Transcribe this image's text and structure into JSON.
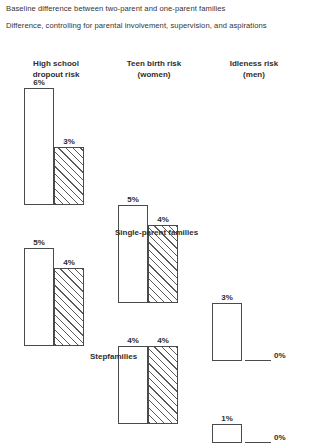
{
  "legend": {
    "lines": [
      "Baseline difference between two-parent and one-parent families",
      "Difference, controlling for parental involvement, supervision, and aspirations"
    ]
  },
  "columns": [
    {
      "title": "High school",
      "subtitle": "dropout risk"
    },
    {
      "title": "Teen birth risk",
      "subtitle": "(women)"
    },
    {
      "title": "Idleness risk",
      "subtitle": "(men)"
    }
  ],
  "groups": [
    {
      "label": "Single-parent families"
    },
    {
      "label": "Stepfamilies"
    }
  ],
  "footnote": "",
  "colors": {
    "bar_outline": "#4a4a4a",
    "bar_fill": "#ffffff",
    "hatch": "#5a5a5a",
    "text": "#2e2e2e",
    "background": "#ffffff"
  },
  "chart_data": {
    "type": "bar",
    "title": "Baseline difference between two-parent and one-parent families",
    "xlabel": "",
    "ylabel": "",
    "ylim": [
      0,
      6
    ],
    "grid": false,
    "legend_position": "top",
    "categories": [
      "High school dropout risk",
      "Teen birth risk (women)",
      "Idleness risk (men)"
    ],
    "panels": [
      {
        "name": "Single-parent families",
        "series": [
          {
            "name": "Baseline difference between two-parent and one-parent families",
            "values": [
              6,
              5,
              3
            ],
            "labels": [
              "6%",
              "5%",
              "3%"
            ],
            "style": "solid"
          },
          {
            "name": "Difference, controlling for parental involvement, supervision, and aspirations",
            "values": [
              3,
              4,
              0
            ],
            "labels": [
              "3%",
              "4%",
              "0%"
            ],
            "style": "hatched"
          }
        ]
      },
      {
        "name": "Stepfamilies",
        "series": [
          {
            "name": "Baseline difference between two-parent and one-parent families",
            "values": [
              5,
              4,
              1
            ],
            "labels": [
              "5%",
              "4%",
              "1%"
            ],
            "style": "solid"
          },
          {
            "name": "Difference, controlling for parental involvement, supervision, and aspirations",
            "values": [
              4,
              4,
              0
            ],
            "labels": [
              "4%",
              "4%",
              "0%"
            ],
            "style": "hatched"
          }
        ]
      }
    ],
    "units": "percentage points"
  }
}
